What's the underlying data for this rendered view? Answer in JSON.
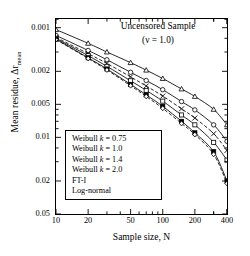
{
  "figure": {
    "title_line1": "Uncensored Sample",
    "title_line2": "(ν = 1.0)",
    "xlabel": "Sample size,   N",
    "ylabel": "Mean residue,  Δr",
    "ylabel_sub": "mean"
  },
  "legend": {
    "items": [
      {
        "label": "Weibull k = 0.75"
      },
      {
        "label": "Weibull k = 1.0"
      },
      {
        "label": "Weibull k = 1.4"
      },
      {
        "label": "Weibull k = 2.0"
      },
      {
        "label": "FT-I"
      },
      {
        "label": "Log-normal"
      }
    ]
  },
  "axes": {
    "x_ticks": [
      "10",
      "20",
      "50",
      "100",
      "200",
      "400"
    ],
    "y_ticks": [
      "0.05",
      "0.02",
      "0.01",
      "0.005",
      "0.002",
      "0.001"
    ]
  },
  "chart_data": {
    "type": "line",
    "title": "Uncensored Sample (ν = 1.0)",
    "xlabel": "Sample size, N",
    "ylabel": "Mean residue, Δr_mean",
    "xscale": "log",
    "yscale": "log",
    "xlim": [
      10,
      400
    ],
    "ylim": [
      0.001,
      0.06
    ],
    "x_ticks": [
      10,
      20,
      50,
      100,
      200,
      400
    ],
    "y_ticks": [
      0.001,
      0.002,
      0.005,
      0.01,
      0.02,
      0.05
    ],
    "grid": false,
    "legend_position": "center-left-inside",
    "x": [
      10,
      20,
      30,
      50,
      70,
      100,
      150,
      200,
      300,
      400
    ],
    "series": [
      {
        "name": "Weibull k = 0.75",
        "marker": "triangle-open",
        "linestyle": "solid",
        "values": [
          0.048,
          0.036,
          0.03,
          0.024,
          0.0205,
          0.0172,
          0.0138,
          0.0118,
          0.009,
          0.0065
        ]
      },
      {
        "name": "Weibull k = 1.0",
        "marker": "circle-open",
        "linestyle": "solid",
        "values": [
          0.0425,
          0.031,
          0.0255,
          0.0196,
          0.0165,
          0.0136,
          0.0106,
          0.0089,
          0.0065,
          0.0046
        ]
      },
      {
        "name": "Weibull k = 1.4",
        "marker": "cross",
        "linestyle": "dashed",
        "values": [
          0.0408,
          0.029,
          0.0236,
          0.0178,
          0.0147,
          0.0119,
          0.0091,
          0.0075,
          0.0054,
          0.0038
        ]
      },
      {
        "name": "Weibull k = 2.0",
        "marker": "square-open",
        "linestyle": "solid",
        "values": [
          0.04,
          0.0278,
          0.0222,
          0.0164,
          0.0134,
          0.0107,
          0.008,
          0.0065,
          0.0045,
          0.0031
        ]
      },
      {
        "name": "FT-I",
        "marker": "square-filled",
        "linestyle": "solid",
        "values": [
          0.0393,
          0.0266,
          0.021,
          0.0152,
          0.0122,
          0.0096,
          0.007,
          0.0055,
          0.0037,
          0.002
        ]
      },
      {
        "name": "Log-normal",
        "marker": "diamond-open",
        "linestyle": "dashed",
        "values": [
          0.039,
          0.0262,
          0.0206,
          0.0148,
          0.0118,
          0.0092,
          0.0067,
          0.0053,
          0.0035,
          0.0019
        ]
      }
    ]
  }
}
